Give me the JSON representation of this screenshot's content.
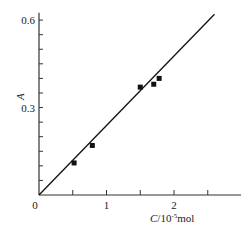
{
  "chart_data": {
    "type": "scatter",
    "title": "",
    "xlabel": "C/10^-5 mol",
    "xlabel_parts": {
      "var": "C",
      "base": "/10",
      "exp": "-5",
      "unit": "mol"
    },
    "ylabel": "A",
    "xlim": [
      0,
      2.9
    ],
    "ylim": [
      0,
      0.62
    ],
    "x_ticks": [
      0.5,
      1,
      1.5,
      2,
      2.5
    ],
    "x_tick_labels": [
      {
        "v": 0,
        "label": "0"
      },
      {
        "v": 1,
        "label": "1"
      },
      {
        "v": 2,
        "label": "2"
      }
    ],
    "y_ticks": [
      0.05,
      0.1,
      0.15,
      0.2,
      0.25,
      0.3,
      0.35,
      0.4,
      0.45,
      0.5,
      0.55,
      0.6
    ],
    "y_tick_labels": [
      {
        "v": 0.3,
        "label": "0.3"
      },
      {
        "v": 0.6,
        "label": "0.6"
      }
    ],
    "grid": false,
    "legend": null,
    "series": [
      {
        "name": "measured",
        "marker": "square",
        "x": [
          0.52,
          0.79,
          1.5,
          1.7,
          1.78
        ],
        "y": [
          0.11,
          0.17,
          0.37,
          0.38,
          0.4
        ]
      },
      {
        "name": "fit line",
        "type": "line",
        "x": [
          0,
          2.6
        ],
        "y": [
          0,
          0.62
        ]
      }
    ]
  }
}
